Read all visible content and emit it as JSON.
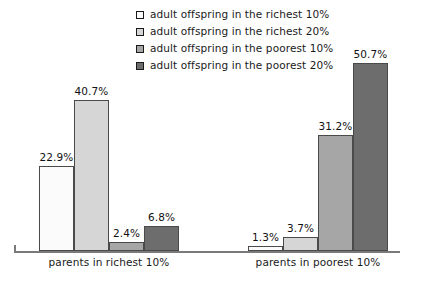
{
  "chart_data": {
    "type": "bar",
    "title": "",
    "subtitle": "",
    "xlabel": "",
    "ylabel": "",
    "grid": false,
    "legend_position": "top-center",
    "ylim": [
      0,
      55
    ],
    "value_suffix": "%",
    "categories": [
      "parents in richest 10%",
      "parents in poorest 10%"
    ],
    "series": [
      {
        "name": "adult offspring in the richest 10%",
        "color": "#fbfbfb",
        "values": [
          22.9,
          1.3
        ],
        "labels": [
          "22.9%",
          "1.3%"
        ]
      },
      {
        "name": "adult offspring in the richest 20%",
        "color": "#d6d6d6",
        "values": [
          40.7,
          3.7
        ],
        "labels": [
          "40.7%",
          "3.7%"
        ]
      },
      {
        "name": "adult offspring in the poorest 10%",
        "color": "#a6a6a6",
        "values": [
          2.4,
          31.2
        ],
        "labels": [
          "2.4%",
          "31.2%"
        ]
      },
      {
        "name": "adult offspring in the poorest 20%",
        "color": "#6d6d6d",
        "values": [
          6.8,
          50.7
        ],
        "labels": [
          "6.8%",
          "50.7%"
        ]
      }
    ]
  },
  "legend": {
    "items": [
      {
        "label": "adult offspring in the richest 10%",
        "color": "#fbfbfb",
        "swatch": "legend-swatch-richest-10"
      },
      {
        "label": "adult offspring in the richest 20%",
        "color": "#d6d6d6",
        "swatch": "legend-swatch-richest-20"
      },
      {
        "label": "adult offspring in the poorest 10%",
        "color": "#a6a6a6",
        "swatch": "legend-swatch-poorest-10"
      },
      {
        "label": "adult offspring in the poorest 20%",
        "color": "#6d6d6d",
        "swatch": "legend-swatch-poorest-20"
      }
    ]
  },
  "axis": {
    "baseline_color": "#7a7a7a",
    "bar_border_color": "#4a4a4a"
  }
}
